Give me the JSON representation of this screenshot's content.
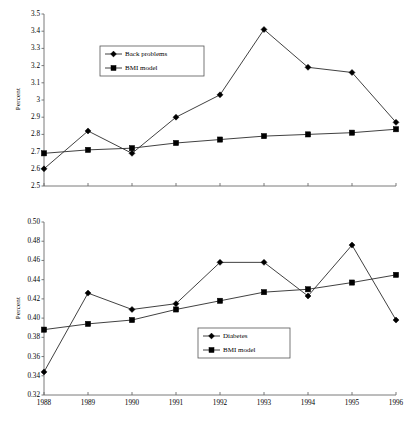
{
  "figure": {
    "background": "#ffffff",
    "line_color": "#2b2b2b",
    "axis_color": "#6b6b6b",
    "marker_color": "#000000"
  },
  "chart_data": [
    {
      "type": "line",
      "title": "",
      "xlabel": "",
      "ylabel": "Percent",
      "categories": [
        "1988",
        "1989",
        "1990",
        "1991",
        "1992",
        "1993",
        "1994",
        "1995",
        "1996"
      ],
      "x": [
        1988,
        1989,
        1990,
        1991,
        1992,
        1993,
        1994,
        1995,
        1996
      ],
      "ylim": [
        2.5,
        3.5
      ],
      "yticks": [
        2.5,
        2.6,
        2.7,
        2.8,
        2.9,
        3.0,
        3.1,
        3.2,
        3.3,
        3.4,
        3.5
      ],
      "ytick_labels": [
        "2.5",
        "2.6",
        "2.7",
        "2.8",
        "2.9",
        "3",
        "3.1",
        "3.2",
        "3.3",
        "3.4",
        "3.5"
      ],
      "xtick_labels_visible": false,
      "grid": false,
      "legend_position": "upper-left-inset",
      "series": [
        {
          "name": "Back problems",
          "marker": "diamond",
          "values": [
            2.6,
            2.82,
            2.69,
            2.9,
            3.03,
            3.41,
            3.19,
            3.16,
            2.87
          ]
        },
        {
          "name": "BMI model",
          "marker": "square",
          "values": [
            2.69,
            2.71,
            2.72,
            2.75,
            2.77,
            2.79,
            2.8,
            2.81,
            2.83
          ]
        }
      ]
    },
    {
      "type": "line",
      "title": "",
      "xlabel": "",
      "ylabel": "Percent",
      "categories": [
        "1988",
        "1989",
        "1990",
        "1991",
        "1992",
        "1993",
        "1994",
        "1995",
        "1996"
      ],
      "x": [
        1988,
        1989,
        1990,
        1991,
        1992,
        1993,
        1994,
        1995,
        1996
      ],
      "ylim": [
        0.32,
        0.5
      ],
      "yticks": [
        0.32,
        0.34,
        0.36,
        0.38,
        0.4,
        0.42,
        0.44,
        0.46,
        0.48,
        0.5
      ],
      "ytick_labels": [
        "0.32",
        "0.34",
        "0.36",
        "0.38",
        "0.40",
        "0.42",
        "0.44",
        "0.46",
        "0.48",
        "0.50"
      ],
      "xtick_labels_visible": true,
      "grid": false,
      "legend_position": "lower-center-inset",
      "series": [
        {
          "name": "Diabetes",
          "marker": "diamond",
          "values": [
            0.344,
            0.426,
            0.409,
            0.415,
            0.458,
            0.458,
            0.423,
            0.476,
            0.398
          ]
        },
        {
          "name": "BMI model",
          "marker": "square",
          "values": [
            0.388,
            0.394,
            0.398,
            0.409,
            0.418,
            0.427,
            0.43,
            0.437,
            0.445
          ]
        }
      ]
    }
  ]
}
